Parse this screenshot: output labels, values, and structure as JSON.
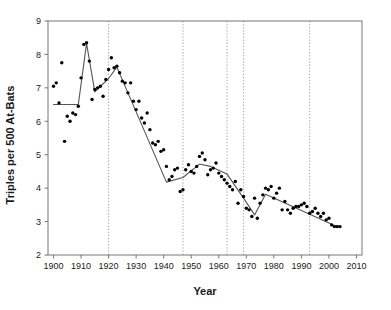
{
  "chart_data": {
    "type": "scatter",
    "title": "",
    "subtitle": "",
    "xlabel": "Year",
    "ylabel": "Triples per 500 At-Bats",
    "xlim": [
      1898,
      2012
    ],
    "ylim": [
      2,
      9
    ],
    "xticks": [
      1900,
      1910,
      1920,
      1930,
      1940,
      1950,
      1960,
      1970,
      1980,
      1990,
      2000,
      2010
    ],
    "xtick_labels": [
      "1900",
      "1910",
      "1920",
      "1930",
      "1940",
      "1950",
      "1960",
      "1970",
      "1980",
      "1990",
      "2000",
      "2010"
    ],
    "yticks": [
      2,
      3,
      4,
      5,
      6,
      7,
      8,
      9
    ],
    "ytick_labels": [
      "2",
      "3",
      "4",
      "5",
      "6",
      "7",
      "8",
      "9"
    ],
    "grid": false,
    "legend": "none",
    "point_color": "#000000",
    "line_color": "#555555",
    "frame_color": "#777777",
    "breakline_color": "#999999",
    "breakpoint_lines": [
      1920,
      1947,
      1963,
      1969,
      1993
    ],
    "series": [
      {
        "name": "Triples per 500 At-Bats",
        "x": [
          1900,
          1901,
          1902,
          1903,
          1904,
          1905,
          1906,
          1907,
          1908,
          1909,
          1910,
          1911,
          1912,
          1913,
          1914,
          1915,
          1916,
          1917,
          1918,
          1919,
          1920,
          1921,
          1922,
          1923,
          1924,
          1925,
          1926,
          1927,
          1928,
          1929,
          1930,
          1931,
          1932,
          1933,
          1934,
          1935,
          1936,
          1937,
          1938,
          1939,
          1940,
          1941,
          1942,
          1943,
          1944,
          1945,
          1946,
          1947,
          1948,
          1949,
          1950,
          1951,
          1952,
          1953,
          1954,
          1955,
          1956,
          1957,
          1958,
          1959,
          1960,
          1961,
          1962,
          1963,
          1964,
          1965,
          1966,
          1967,
          1968,
          1969,
          1970,
          1971,
          1972,
          1973,
          1974,
          1975,
          1976,
          1977,
          1978,
          1979,
          1980,
          1981,
          1982,
          1983,
          1984,
          1985,
          1986,
          1987,
          1988,
          1989,
          1990,
          1991,
          1992,
          1993,
          1994,
          1995,
          1996,
          1997,
          1998,
          1999,
          2000,
          2001,
          2002,
          2003,
          2004
        ],
        "y": [
          7.05,
          7.15,
          6.55,
          7.75,
          5.4,
          6.15,
          6.0,
          6.25,
          6.2,
          6.45,
          7.3,
          8.3,
          8.35,
          7.8,
          6.65,
          6.95,
          7.0,
          7.05,
          6.75,
          7.25,
          7.55,
          7.9,
          7.6,
          7.65,
          7.45,
          7.2,
          7.15,
          6.85,
          7.15,
          6.6,
          6.35,
          6.6,
          6.1,
          5.95,
          6.25,
          5.75,
          5.35,
          5.3,
          5.4,
          5.1,
          5.15,
          4.65,
          4.25,
          4.35,
          4.55,
          4.6,
          3.9,
          3.95,
          4.55,
          4.7,
          4.5,
          4.45,
          4.65,
          4.95,
          5.05,
          4.85,
          4.4,
          4.55,
          4.6,
          4.75,
          4.45,
          4.35,
          4.25,
          4.15,
          4.05,
          3.95,
          4.2,
          3.55,
          3.95,
          3.75,
          3.4,
          3.35,
          3.15,
          3.7,
          3.1,
          3.55,
          3.8,
          4.0,
          3.95,
          4.05,
          3.7,
          3.85,
          4.0,
          3.35,
          3.6,
          3.35,
          3.25,
          3.4,
          3.45,
          3.45,
          3.5,
          3.55,
          3.45,
          3.25,
          3.3,
          3.4,
          3.25,
          3.15,
          3.25,
          3.05,
          3.1,
          2.9,
          2.85,
          2.85,
          2.85
        ]
      }
    ],
    "trend_line": {
      "name": "segmented-regression-fit",
      "points": [
        {
          "x": 1900,
          "y": 6.5
        },
        {
          "x": 1909,
          "y": 6.5
        },
        {
          "x": 1912,
          "y": 8.33
        },
        {
          "x": 1915,
          "y": 6.88
        },
        {
          "x": 1920,
          "y": 7.28
        },
        {
          "x": 1923,
          "y": 7.62
        },
        {
          "x": 1941,
          "y": 4.18
        },
        {
          "x": 1947,
          "y": 4.32
        },
        {
          "x": 1953,
          "y": 4.72
        },
        {
          "x": 1957,
          "y": 4.65
        },
        {
          "x": 1963,
          "y": 4.42
        },
        {
          "x": 1969,
          "y": 3.7
        },
        {
          "x": 1973,
          "y": 3.2
        },
        {
          "x": 1977,
          "y": 3.82
        },
        {
          "x": 1993,
          "y": 3.22
        },
        {
          "x": 2002,
          "y": 2.88
        },
        {
          "x": 2004,
          "y": 2.85
        }
      ]
    }
  },
  "figure": {
    "axis_label_x": "Year",
    "axis_label_y": "Triples per 500 At-Bats"
  }
}
